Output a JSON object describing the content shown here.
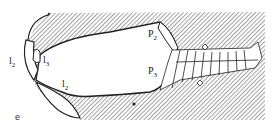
{
  "figure": {
    "panel_label": "e",
    "labels": [
      {
        "id": "l2-left",
        "base": "l",
        "sub": "2"
      },
      {
        "id": "l3",
        "base": "l",
        "sub": "3"
      },
      {
        "id": "l2-lower",
        "base": "l",
        "sub": "2"
      },
      {
        "id": "P2",
        "base": "P",
        "sub": "2"
      },
      {
        "id": "P3",
        "base": "P",
        "sub": "3"
      }
    ],
    "colors": {
      "ink": "#222222",
      "background": "#ffffff",
      "hatch": "#555555"
    }
  }
}
